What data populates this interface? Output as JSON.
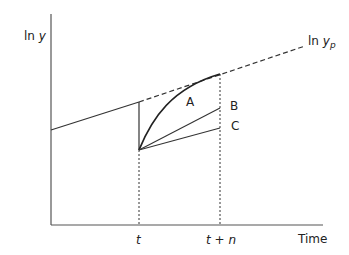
{
  "diagram": {
    "y_axis_label": {
      "prefix": "ln ",
      "var": "y"
    },
    "trend_label": {
      "prefix": "ln ",
      "var": "y",
      "sub": "p"
    },
    "x_axis_label": "Time",
    "x_ticks": [
      {
        "label": "t"
      },
      {
        "label": "t + n"
      }
    ],
    "paths": [
      {
        "label": "A",
        "kind": "curve"
      },
      {
        "label": "B",
        "kind": "line"
      },
      {
        "label": "C",
        "kind": "line"
      }
    ],
    "colors": {
      "line": "#333333",
      "background": "#ffffff"
    }
  }
}
